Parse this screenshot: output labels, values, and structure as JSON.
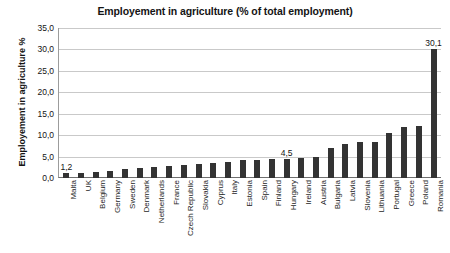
{
  "chart_data": {
    "type": "bar",
    "title": "Employement in agriculture (% of total employment)",
    "xlabel": "",
    "ylabel": "Employement in agriculture %",
    "ylim": [
      0.0,
      35.0
    ],
    "ytick_step": 5.0,
    "ytick_labels": [
      "35,0",
      "30,0",
      "25,0",
      "20,0",
      "15,0",
      "10,0",
      "5,0",
      "0,0"
    ],
    "ytick_values": [
      35.0,
      30.0,
      25.0,
      20.0,
      15.0,
      10.0,
      5.0,
      0.0
    ],
    "grid": true,
    "legend": false,
    "bar_color": "#333333",
    "categories": [
      "Malta",
      "UK",
      "Belgium",
      "Germany",
      "Sweden",
      "Denmark",
      "Netherlands",
      "France",
      "Czech Republic",
      "Slovakia",
      "Cyprus",
      "Italy",
      "Estonia",
      "Spain",
      "Finland",
      "Hungary",
      "Ireland",
      "Austria",
      "Bulgaria",
      "Latvia",
      "Slovenia",
      "Lithuania",
      "Portugal",
      "Greece",
      "Poland",
      "Romania"
    ],
    "values": [
      1.2,
      1.2,
      1.3,
      1.6,
      2.0,
      2.4,
      2.6,
      2.9,
      3.1,
      3.2,
      3.4,
      3.7,
      4.2,
      4.2,
      4.4,
      4.5,
      4.7,
      4.8,
      6.9,
      8.0,
      8.4,
      8.4,
      10.5,
      12.0,
      12.1,
      30.1
    ],
    "annotations": [
      {
        "label": "1,2",
        "category": "Malta",
        "value": 1.2
      },
      {
        "label": "4,5",
        "category": "Hungary",
        "value": 4.5
      },
      {
        "label": "30,1",
        "category": "Romania",
        "value": 30.1
      }
    ]
  }
}
